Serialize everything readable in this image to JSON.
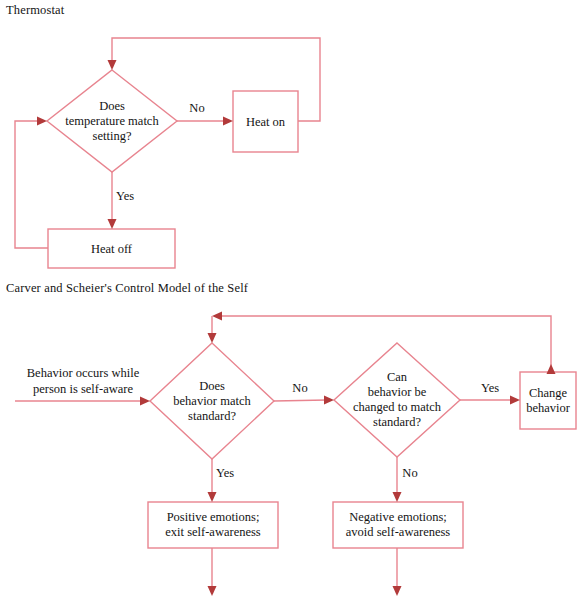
{
  "page": {
    "width": 586,
    "height": 615,
    "background": "#ffffff",
    "line_color": "#e8848f",
    "arrow_color": "#b23a3a",
    "text_color": "#141414"
  },
  "diagrams": [
    {
      "id": "thermostat",
      "title": "Thermostat",
      "nodes": [
        {
          "id": "t-decision",
          "type": "diamond",
          "text": "Does\ntemperature match\nsetting?",
          "cx": 112,
          "cy": 121,
          "rx": 65,
          "ry": 51
        },
        {
          "id": "t-heat-on",
          "type": "box",
          "text": "Heat on",
          "x": 233,
          "y": 91,
          "w": 65,
          "h": 61
        },
        {
          "id": "t-heat-off",
          "type": "box",
          "text": "Heat off",
          "x": 48,
          "y": 229,
          "w": 127,
          "h": 39
        }
      ],
      "edges": [
        {
          "id": "t-no",
          "label": "No",
          "label_x": 197,
          "label_y": 108,
          "from": "t-decision",
          "to": "t-heat-on"
        },
        {
          "id": "t-yes",
          "label": "Yes",
          "label_x": 125,
          "label_y": 196,
          "from": "t-decision",
          "to": "t-heat-off"
        },
        {
          "id": "t-loop-top",
          "label": "",
          "from": "t-heat-on",
          "to": "t-decision"
        },
        {
          "id": "t-loop-left",
          "label": "",
          "from": "t-heat-off",
          "to": "t-decision"
        }
      ]
    },
    {
      "id": "carver-scheier",
      "title": "Carver and Scheier's Control Model of the Self",
      "entry_label": "Behavior occurs while\nperson is self-aware",
      "nodes": [
        {
          "id": "c-decision-1",
          "type": "diamond",
          "text": "Does\nbehavior match\nstandard?",
          "cx": 212,
          "cy": 401,
          "rx": 62,
          "ry": 58
        },
        {
          "id": "c-decision-2",
          "type": "diamond",
          "text": "Can\nbehavior be\nchanged to match\nstandard?",
          "cx": 397,
          "cy": 400,
          "rx": 63,
          "ry": 57
        },
        {
          "id": "c-change",
          "type": "box",
          "text": "Change\nbehavior",
          "x": 520,
          "y": 372,
          "w": 56,
          "h": 57
        },
        {
          "id": "c-positive",
          "type": "box",
          "text": "Positive emotions;\nexit self-awareness",
          "x": 148,
          "y": 502,
          "w": 130,
          "h": 46
        },
        {
          "id": "c-negative",
          "type": "box",
          "text": "Negative emotions;\navoid self-awareness",
          "x": 333,
          "y": 502,
          "w": 130,
          "h": 46
        }
      ],
      "edges": [
        {
          "id": "c-no-1",
          "label": "No",
          "label_x": 300,
          "label_y": 388,
          "from": "c-decision-1",
          "to": "c-decision-2"
        },
        {
          "id": "c-yes-1",
          "label": "Yes",
          "label_x": 225,
          "label_y": 473,
          "from": "c-decision-1",
          "to": "c-positive"
        },
        {
          "id": "c-yes-2",
          "label": "Yes",
          "label_x": 490,
          "label_y": 388,
          "from": "c-decision-2",
          "to": "c-change"
        },
        {
          "id": "c-no-2",
          "label": "No",
          "label_x": 410,
          "label_y": 473,
          "from": "c-decision-2",
          "to": "c-negative"
        },
        {
          "id": "c-loop",
          "label": "",
          "from": "c-change",
          "to": "c-decision-1"
        },
        {
          "id": "c-out-positive",
          "label": "",
          "from": "c-positive",
          "to": ""
        },
        {
          "id": "c-out-negative",
          "label": "",
          "from": "c-negative",
          "to": ""
        }
      ]
    }
  ]
}
